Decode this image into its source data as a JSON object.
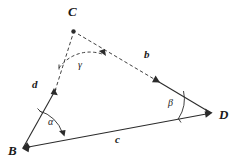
{
  "figure": {
    "type": "geometry-diagram",
    "background_color": "#ffffff",
    "stroke_color": "#2b2b2b",
    "text_color": "#1a1a1a"
  },
  "vertices": [
    {
      "name": "vertex-C",
      "label": "C",
      "point_x": 73,
      "point_y": 31,
      "label_x": 68,
      "label_y": 6,
      "has_dot": true
    },
    {
      "name": "vertex-D",
      "label": "D",
      "point_x": 211,
      "point_y": 113,
      "label_x": 219,
      "label_y": 110,
      "has_dot": false
    },
    {
      "name": "vertex-B",
      "label": "B",
      "point_x": 23,
      "point_y": 148,
      "label_x": 10,
      "label_y": 145,
      "has_dot": false
    }
  ],
  "sides": [
    {
      "name": "side-d",
      "label": "d",
      "label_x": 33,
      "label_y": 80,
      "from": "B",
      "to": "C",
      "solid_from_x": 23,
      "solid_from_y": 148,
      "solid_to_x": 54,
      "solid_to_y": 92,
      "dashed_from_x": 54,
      "dashed_from_y": 92,
      "dashed_to_x": 73,
      "dashed_to_y": 33,
      "arrow_at_x": 54,
      "arrow_at_y": 92,
      "style": "solid-then-dashed"
    },
    {
      "name": "side-b",
      "label": "b",
      "label_x": 144,
      "label_y": 50,
      "from": "C",
      "to": "D",
      "dashed_from_x": 78,
      "dashed_from_y": 34,
      "dashed_to_x": 157,
      "dashed_to_y": 81,
      "solid_from_x": 157,
      "solid_from_y": 81,
      "solid_to_x": 211,
      "solid_to_y": 113,
      "arrow_at_x": 157,
      "arrow_at_y": 81,
      "style": "dashed-then-solid"
    },
    {
      "name": "side-c",
      "label": "c",
      "label_x": 115,
      "label_y": 136,
      "from": "B",
      "to": "D",
      "solid_from_x": 23,
      "solid_from_y": 148,
      "solid_to_x": 211,
      "solid_to_y": 113,
      "style": "solid",
      "arrow_at_end": true
    }
  ],
  "angles": [
    {
      "name": "angle-alpha",
      "label": "α",
      "label_x": 49,
      "label_y": 120,
      "at_vertex": "B",
      "arc_style": "solid",
      "arc_path": "M 39 112 A 32 32 0 0 1 60 135",
      "has_arrowhead": true
    },
    {
      "name": "angle-beta",
      "label": "β",
      "label_x": 169,
      "label_y": 101,
      "at_vertex": "D",
      "arc_style": "solid",
      "arc_path": "M 181 92 A 34 34 0 0 1 178 118",
      "has_arrowhead": false
    },
    {
      "name": "angle-gamma",
      "label": "γ",
      "label_x": 79,
      "label_y": 62,
      "at_vertex": "C",
      "arc_style": "dashed",
      "arc_path": "M 60 68 A 40 40 0 0 1 104 53",
      "has_arrowhead": true
    }
  ]
}
